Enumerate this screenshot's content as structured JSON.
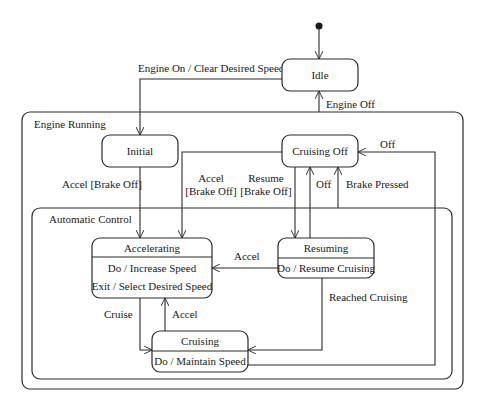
{
  "diagram": {
    "type": "uml-state-machine",
    "initial_pseudostate": {
      "x": 319,
      "y": 26
    },
    "regions": [
      {
        "id": "engine_running",
        "label": "Engine Running",
        "x": 22,
        "y": 112,
        "w": 441,
        "h": 277,
        "r": 8
      },
      {
        "id": "automatic_control",
        "label": "Automatic Control",
        "x": 32,
        "y": 208,
        "w": 420,
        "h": 171,
        "r": 8
      }
    ],
    "states": [
      {
        "id": "idle",
        "name": "Idle",
        "x": 282,
        "y": 59,
        "w": 76,
        "h": 32,
        "activities": []
      },
      {
        "id": "initial",
        "name": "Initial",
        "x": 102,
        "y": 135,
        "w": 76,
        "h": 32,
        "activities": []
      },
      {
        "id": "cruising_off",
        "name": "Cruising Off",
        "x": 282,
        "y": 135,
        "w": 76,
        "h": 32,
        "activities": []
      },
      {
        "id": "accelerating",
        "name": "Accelerating",
        "x": 92,
        "y": 238,
        "w": 120,
        "h": 60,
        "activities": [
          "Do / Increase Speed",
          "Exit / Select Desired Speed"
        ]
      },
      {
        "id": "resuming",
        "name": "Resuming",
        "x": 278,
        "y": 238,
        "w": 96,
        "h": 40,
        "activities": [
          "Do / Resume Cruising"
        ]
      },
      {
        "id": "cruising",
        "name": "Cruising",
        "x": 152,
        "y": 331,
        "w": 96,
        "h": 41,
        "activities": [
          "Do / Maintain Speed"
        ]
      }
    ],
    "transitions": [
      {
        "from": "initial_pseudostate",
        "to": "idle",
        "label": ""
      },
      {
        "from": "idle",
        "to": "initial",
        "label": "Engine On / Clear Desired Speed"
      },
      {
        "from": "engine_running",
        "to": "idle",
        "label": "Engine Off"
      },
      {
        "from": "initial",
        "to": "accelerating",
        "label": "Accel [Brake Off]"
      },
      {
        "from": "cruising_off",
        "to": "accelerating",
        "label": "Accel\n[Brake Off]"
      },
      {
        "from": "cruising_off",
        "to": "resuming",
        "label": "Resume\n[Brake Off]"
      },
      {
        "from": "resuming",
        "to": "cruising_off",
        "label": "Off"
      },
      {
        "from": "automatic_control",
        "to": "cruising_off",
        "label": "Brake Pressed"
      },
      {
        "from": "cruising",
        "to": "cruising_off",
        "label": "Off"
      },
      {
        "from": "resuming",
        "to": "accelerating",
        "label": "Accel"
      },
      {
        "from": "resuming",
        "to": "cruising",
        "label": "Reached Cruising"
      },
      {
        "from": "accelerating",
        "to": "cruising",
        "label": "Cruise"
      },
      {
        "from": "cruising",
        "to": "accelerating",
        "label": "Accel"
      }
    ]
  },
  "labels": {
    "engine_on": "Engine On / Clear Desired Speed",
    "engine_off": "Engine Off",
    "accel_brake_off_initial": "Accel [Brake Off]",
    "accel_line1": "Accel",
    "accel_line2": "[Brake Off]",
    "resume_line1": "Resume",
    "resume_line2": "[Brake Off]",
    "off_resuming": "Off",
    "brake_pressed": "Brake Pressed",
    "off_cruising": "Off",
    "accel_resuming": "Accel",
    "reached_cruising": "Reached Cruising",
    "cruise": "Cruise",
    "accel_cruising": "Accel"
  },
  "colors": {
    "stroke": "#2a2a2a",
    "text": "#1a1a1a",
    "background": "#ffffff"
  }
}
